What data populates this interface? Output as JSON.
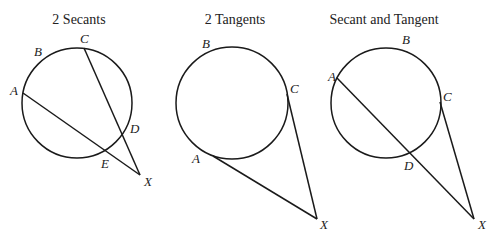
{
  "diagrams": [
    {
      "title": "2 Secants",
      "circle": {
        "cx": 77,
        "cy": 103,
        "r": 55
      },
      "points": {
        "A": {
          "x": 23,
          "y": 93,
          "lx": 10,
          "ly": 95
        },
        "B": {
          "x": 50,
          "y": 55,
          "lx": 34,
          "ly": 56
        },
        "C": {
          "x": 84,
          "y": 48,
          "lx": 80,
          "ly": 43
        },
        "D": {
          "x": 126,
          "y": 129,
          "lx": 130,
          "ly": 133
        },
        "E": {
          "x": 107,
          "y": 149,
          "lx": 101,
          "ly": 168
        },
        "X": {
          "x": 140,
          "y": 175,
          "lx": 144,
          "ly": 186
        }
      },
      "labels": [
        "A",
        "B",
        "C",
        "D",
        "E",
        "X"
      ]
    },
    {
      "title": "2 Tangents",
      "circle": {
        "cx": 232,
        "cy": 103,
        "r": 56
      },
      "points": {
        "A": {
          "x": 213,
          "y": 156,
          "lx": 192,
          "ly": 163
        },
        "B": {
          "x": 210,
          "y": 50,
          "lx": 202,
          "ly": 48
        },
        "C": {
          "x": 287,
          "y": 94,
          "lx": 290,
          "ly": 93
        },
        "X": {
          "x": 317,
          "y": 219,
          "lx": 320,
          "ly": 229
        }
      },
      "labels": [
        "A",
        "B",
        "C",
        "X"
      ]
    },
    {
      "title": "Secant and Tangent",
      "circle": {
        "cx": 386,
        "cy": 103,
        "r": 55
      },
      "points": {
        "A": {
          "x": 337,
          "y": 78,
          "lx": 328,
          "ly": 81
        },
        "B": {
          "x": 405,
          "y": 49,
          "lx": 402,
          "ly": 44
        },
        "C": {
          "x": 440,
          "y": 102,
          "lx": 443,
          "ly": 101
        },
        "D": {
          "x": 412,
          "y": 152,
          "lx": 404,
          "ly": 170
        },
        "X": {
          "x": 474,
          "y": 219,
          "lx": 478,
          "ly": 229
        }
      },
      "labels": [
        "A",
        "B",
        "C",
        "D",
        "X"
      ]
    }
  ]
}
